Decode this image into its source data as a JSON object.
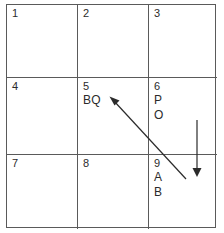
{
  "diagram": {
    "background_color": "#ffffff",
    "line_color": "#5a5a5a",
    "text_color": "#2b2b2b",
    "grid": {
      "rows": 3,
      "columns": 3,
      "cells": [
        {
          "number": "1",
          "lines": []
        },
        {
          "number": "2",
          "lines": []
        },
        {
          "number": "3",
          "lines": []
        },
        {
          "number": "4",
          "lines": []
        },
        {
          "number": "5",
          "lines": [
            "BQ"
          ]
        },
        {
          "number": "6",
          "lines": [
            "P",
            "O"
          ]
        },
        {
          "number": "7",
          "lines": []
        },
        {
          "number": "8",
          "lines": []
        },
        {
          "number": "9",
          "lines": [
            "A",
            "B"
          ]
        }
      ]
    },
    "arrows": [
      {
        "name": "diagonal-arrow",
        "from_cell": "9",
        "to_cell": "5",
        "direction": "up-left",
        "color": "#2b2b2b"
      },
      {
        "name": "vertical-arrow",
        "from_cell": "6",
        "to_cell": "9",
        "direction": "down",
        "color": "#2b2b2b"
      }
    ]
  }
}
